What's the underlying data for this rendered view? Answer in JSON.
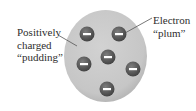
{
  "diagram": {
    "type": "plum-pudding-atom-model",
    "labels": {
      "pudding": {
        "lines": [
          "Positively",
          "charged",
          "“pudding”"
        ]
      },
      "electron": {
        "lines": [
          "Electron",
          "“plum”"
        ]
      }
    },
    "electron_symbol": "−",
    "electron_count": 6,
    "colors": {
      "pudding_fill": "#c9c9c9",
      "pudding_edge": "#b5b5b5",
      "electron_fill": "#565656",
      "electron_highlight": "#8a8a8a",
      "minus_bar": "#ffffff",
      "text": "#2e2e2e",
      "leader_line": "#555555"
    }
  }
}
